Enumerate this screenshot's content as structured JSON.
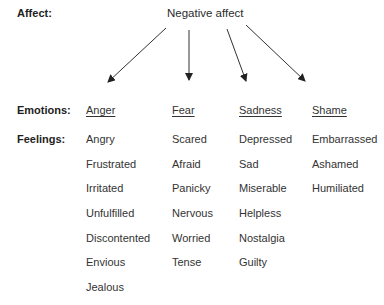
{
  "diagram": {
    "row_labels": {
      "affect": "Affect:",
      "emotions": "Emotions:",
      "feelings": "Feelings:"
    },
    "root": "Negative affect",
    "colors": {
      "text": "#333333",
      "arrow": "#222222"
    },
    "arrows": [
      {
        "from": [
          166,
          28
        ],
        "to": [
          108,
          82
        ],
        "target": "Anger"
      },
      {
        "from": [
          189,
          30
        ],
        "to": [
          189,
          80
        ],
        "target": "Fear"
      },
      {
        "from": [
          227,
          29
        ],
        "to": [
          246,
          81
        ],
        "target": "Sadness"
      },
      {
        "from": [
          246,
          25
        ],
        "to": [
          305,
          81
        ],
        "target": "Shame"
      }
    ],
    "columns": [
      {
        "emotion": "Anger",
        "feelings": [
          "Angry",
          "Frustrated",
          "Irritated",
          "Unfulfilled",
          "Discontented",
          "Envious",
          "Jealous"
        ]
      },
      {
        "emotion": "Fear",
        "feelings": [
          "Scared",
          "Afraid",
          "Panicky",
          "Nervous",
          "Worried",
          "Tense"
        ]
      },
      {
        "emotion": "Sadness",
        "feelings": [
          "Depressed",
          "Sad",
          "Miserable",
          "Helpless",
          "Nostalgia",
          "Guilty"
        ]
      },
      {
        "emotion": "Shame",
        "feelings": [
          "Embarrassed",
          "Ashamed",
          "Humiliated"
        ]
      }
    ]
  }
}
